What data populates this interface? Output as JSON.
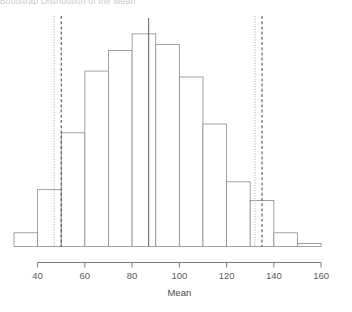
{
  "plot": {
    "title": "Bootstrap Distribution of the Mean",
    "axis_x_label": "Mean",
    "axis_color": "#6b6b6b",
    "bar_border_color": "#8a8a8a",
    "bar_fill_color": "#ffffff",
    "tick_label_color": "#5a5a5a"
  },
  "chart_data": {
    "type": "bar",
    "title": "Bootstrap Distribution of the Mean",
    "xlabel": "Mean",
    "ylabel": "",
    "grid": false,
    "legend": "none",
    "bin_width": 10,
    "xlim": [
      30,
      170
    ],
    "ylim": [
      0,
      230
    ],
    "axis_ticks_x": [
      40,
      60,
      80,
      100,
      120,
      140,
      160
    ],
    "axis_tick_labels_x": [
      "40",
      "60",
      "80",
      "100",
      "120",
      "140",
      "160"
    ],
    "bins": [
      {
        "start": 30,
        "end": 40,
        "label": "30-40",
        "count": 14
      },
      {
        "start": 40,
        "end": 50,
        "label": "40-50",
        "count": 58
      },
      {
        "start": 50,
        "end": 60,
        "label": "50-60",
        "count": 116
      },
      {
        "start": 60,
        "end": 70,
        "label": "60-70",
        "count": 179
      },
      {
        "start": 70,
        "end": 80,
        "label": "70-80",
        "count": 200
      },
      {
        "start": 80,
        "end": 90,
        "label": "80-90",
        "count": 217
      },
      {
        "start": 90,
        "end": 100,
        "label": "90-100",
        "count": 206
      },
      {
        "start": 100,
        "end": 110,
        "label": "100-110",
        "count": 173
      },
      {
        "start": 110,
        "end": 120,
        "label": "110-120",
        "count": 125
      },
      {
        "start": 120,
        "end": 130,
        "label": "120-130",
        "count": 66
      },
      {
        "start": 130,
        "end": 140,
        "label": "130-140",
        "count": 47
      },
      {
        "start": 140,
        "end": 150,
        "label": "140-150",
        "count": 14
      },
      {
        "start": 150,
        "end": 160,
        "label": "150-160",
        "count": 3
      }
    ],
    "categories": [
      "30-40",
      "40-50",
      "50-60",
      "60-70",
      "70-80",
      "80-90",
      "90-100",
      "100-110",
      "110-120",
      "120-130",
      "130-140",
      "140-150",
      "150-160"
    ],
    "values": [
      14,
      58,
      116,
      179,
      200,
      217,
      206,
      173,
      125,
      66,
      47,
      14,
      3
    ],
    "reference_lines": [
      {
        "name": "percentile-lower",
        "value": 47,
        "style": "dotted",
        "color": "#c0c0c0"
      },
      {
        "name": "normal-lower",
        "value": 50,
        "style": "dashed",
        "color": "#555555"
      },
      {
        "name": "observed-mean",
        "value": 87,
        "style": "solid",
        "color": "#6b6b6b"
      },
      {
        "name": "percentile-upper",
        "value": 132,
        "style": "dotted",
        "color": "#c0c0c0"
      },
      {
        "name": "normal-upper",
        "value": 135,
        "style": "dashed",
        "color": "#555555"
      }
    ]
  }
}
